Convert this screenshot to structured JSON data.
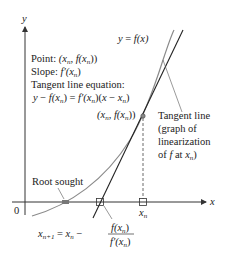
{
  "figure": {
    "colors": {
      "axis": "#333333",
      "curve": "#8a8a8a",
      "tangent": "#222222",
      "background": "#ffffff",
      "root_marker": "#777777"
    },
    "axes": {
      "x_label": "x",
      "y_label": "y",
      "origin_label": "0"
    },
    "curve": {
      "label": "y = f(x)"
    },
    "annotations": {
      "point_line": "Point: (x_n, f(x_n))",
      "point_prefix": "Point: ",
      "slope_prefix": "Slope: ",
      "slope_value": "f′(x_n)",
      "tangent_eq_title": "Tangent line equation:",
      "tangent_eq": "y − f(x_n) = f′(x_n)(x − x_n)",
      "point_label": "(x_n, f(x_n))",
      "tangent_line_label": [
        "Tangent line",
        "(graph of",
        "linearization",
        "of f at x_n)"
      ],
      "root_label": "Root sought",
      "xn_tick_label": "x_n",
      "newton_formula": "x_{n+1} = x_n − f(x_n) / f′(x_n)"
    }
  }
}
